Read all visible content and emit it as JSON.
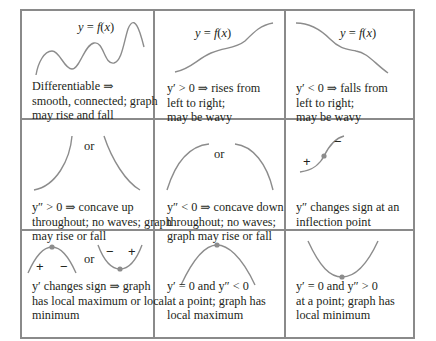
{
  "table": {
    "border_color": "#8a8a8a",
    "curve_color": "#8c8c8c",
    "rows": [
      [
        {
          "graph": "wavy-rising-curve",
          "curve_label": "y = f(x)",
          "caption": [
            "Differentiable ⇒",
            "smooth, connected; graph",
            "may rise and fall"
          ]
        },
        {
          "graph": "increasing-curve",
          "curve_label": "y = f(x)",
          "caption": [
            "y′ > 0 ⇒ rises from",
            "left to right;",
            "may be wavy"
          ]
        },
        {
          "graph": "decreasing-curve",
          "curve_label": "y = f(x)",
          "caption": [
            "y′ < 0 ⇒ falls from",
            "left to right;",
            "may be wavy"
          ]
        }
      ],
      [
        {
          "graph": "concave-up-arcs",
          "separator": "or",
          "caption": [
            "y″ > 0 ⇒ concave up",
            "throughout; no waves; graph",
            "may rise or fall"
          ]
        },
        {
          "graph": "concave-down-arcs",
          "separator": "or",
          "caption": [
            "y″ < 0 ⇒ concave down",
            "throughout; no waves;",
            "graph may rise or fall"
          ]
        },
        {
          "graph": "inflection-curve",
          "signs": [
            "+",
            "−"
          ],
          "caption": [
            "y″ changes sign at an",
            "inflection point"
          ]
        }
      ],
      [
        {
          "graph": "max-or-min-curves",
          "separator": "or",
          "signs_max": [
            "+",
            "−"
          ],
          "signs_min": [
            "−",
            "+"
          ],
          "caption": [
            "y′ changes sign ⇒ graph",
            "has local maximum or local",
            "minimum"
          ]
        },
        {
          "graph": "local-maximum-curve",
          "caption": [
            "y′ = 0  and  y″ < 0",
            "at a point; graph has",
            "local maximum"
          ]
        },
        {
          "graph": "local-minimum-curve",
          "caption": [
            "y′ = 0  and  y″ > 0",
            "at a point; graph has",
            "local minimum"
          ]
        }
      ]
    ]
  }
}
